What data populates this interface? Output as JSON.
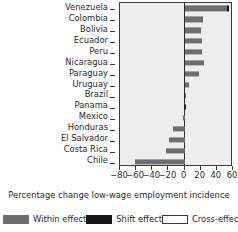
{
  "chart_data": {
    "type": "bar",
    "orientation": "horizontal",
    "title": "",
    "xlabel": "Percentage change low-wage employment incidence",
    "ylabel": "",
    "xlim": [
      -80,
      60
    ],
    "xticks": [
      -80,
      -60,
      -40,
      -20,
      0,
      20,
      40,
      60
    ],
    "xticklabels": [
      "−80",
      "−60",
      "−40",
      "−20",
      "0",
      "20",
      "40",
      "60"
    ],
    "grid": false,
    "legend_position": "below",
    "categories": [
      "Venezuela",
      "Colombia",
      "Bolivia",
      "Ecuador",
      "Peru",
      "Nicaragua",
      "Paraguay",
      "Uruguay",
      "Brazil",
      "Panama",
      "Mexico",
      "Honduras",
      "El Salvador",
      "Costa Rica",
      "Chile"
    ],
    "series": [
      {
        "name": "Within effect",
        "color": "#6e6e6e",
        "values": [
          52.0,
          23.0,
          20.5,
          22.0,
          22.0,
          23.5,
          18.0,
          5.5,
          2.0,
          0.0,
          -2.5,
          -14.0,
          -19.5,
          -23.0,
          -62.0
        ]
      },
      {
        "name": "Shift effect",
        "color": "#161616",
        "values": [
          3.5,
          0.0,
          0.0,
          0.0,
          0.0,
          0.0,
          0.0,
          0.0,
          0.0,
          1.5,
          0.0,
          0.0,
          0.0,
          0.0,
          0.0
        ]
      },
      {
        "name": "Cross-effect",
        "color": "#ffffff",
        "values": [
          0.0,
          0.0,
          0.0,
          0.0,
          0.0,
          0.0,
          0.0,
          0.0,
          0.0,
          0.0,
          0.0,
          0.0,
          0.0,
          0.0,
          0.0
        ]
      }
    ]
  },
  "legend": {
    "items": [
      {
        "label": "Within effect",
        "swatch": "within-swatch"
      },
      {
        "label": "Shift effect",
        "swatch": "shift-swatch"
      },
      {
        "label": "Cross-effect",
        "swatch": "cross-swatch"
      }
    ]
  },
  "axis": {
    "x_title": "Percentage change low-wage employment incidence"
  }
}
